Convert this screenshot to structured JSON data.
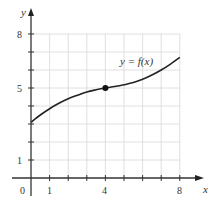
{
  "chart_data": {
    "type": "line",
    "title": "",
    "xlabel": "x",
    "ylabel": "y",
    "xlim": [
      0,
      8
    ],
    "ylim": [
      0,
      8
    ],
    "grid": true,
    "x_ticks": [
      0,
      1,
      2,
      3,
      4,
      5,
      6,
      7,
      8
    ],
    "y_ticks": [
      1,
      2,
      3,
      4,
      5,
      6,
      7,
      8
    ],
    "x_tick_labels": [
      {
        "value": 0,
        "label": "0"
      },
      {
        "value": 1,
        "label": "1"
      },
      {
        "value": 4,
        "label": "4"
      },
      {
        "value": 8,
        "label": "8"
      }
    ],
    "y_tick_labels": [
      {
        "value": 1,
        "label": "1"
      },
      {
        "value": 5,
        "label": "5"
      },
      {
        "value": 8,
        "label": "8"
      }
    ],
    "series": [
      {
        "name": "y = f(x)",
        "x": [
          0,
          0.5,
          1,
          1.5,
          2,
          2.5,
          3,
          3.5,
          4,
          4.5,
          5,
          5.5,
          6,
          6.5,
          7,
          7.5,
          8
        ],
        "values": [
          3.1,
          3.5,
          3.85,
          4.15,
          4.4,
          4.6,
          4.78,
          4.9,
          5.0,
          5.08,
          5.18,
          5.3,
          5.48,
          5.72,
          6.0,
          6.33,
          6.7
        ]
      }
    ],
    "marked_points": [
      {
        "x": 4,
        "y": 5
      }
    ],
    "annotations": [
      {
        "text": "y = f(x)",
        "x": 5.3,
        "y": 6.5
      }
    ]
  },
  "labels": {
    "x_axis": "x",
    "y_axis": "y",
    "origin": "0",
    "x1": "1",
    "x4": "4",
    "x8": "8",
    "y1": "1",
    "y5": "5",
    "y8": "8",
    "curve_label": "y = f(x)"
  }
}
